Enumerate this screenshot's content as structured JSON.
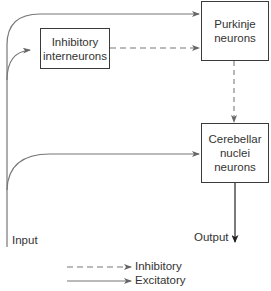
{
  "diagram": {
    "nodes": {
      "inhibitory_interneurons": {
        "line1": "Inhibitory",
        "line2": "interneurons"
      },
      "purkinje": {
        "line1": "Purkinje",
        "line2": "neurons"
      },
      "cerebellar_nuclei": {
        "line1": "Cerebellar",
        "line2": "nuclei",
        "line3": "neurons"
      }
    },
    "labels": {
      "input": "Input",
      "output": "Output"
    },
    "legend": {
      "inhibitory": "Inhibitory",
      "excitatory": "Excitatory"
    },
    "edges": [
      {
        "from": "Input",
        "to": "Purkinje neurons",
        "type": "excitatory"
      },
      {
        "from": "Input",
        "to": "Inhibitory interneurons",
        "type": "excitatory"
      },
      {
        "from": "Input",
        "to": "Cerebellar nuclei neurons",
        "type": "excitatory"
      },
      {
        "from": "Inhibitory interneurons",
        "to": "Purkinje neurons",
        "type": "inhibitory"
      },
      {
        "from": "Purkinje neurons",
        "to": "Cerebellar nuclei neurons",
        "type": "inhibitory"
      },
      {
        "from": "Cerebellar nuclei neurons",
        "to": "Output",
        "type": "excitatory"
      }
    ],
    "colors": {
      "line": "#666666",
      "box_border": "#3a3a3a",
      "output_line": "#222222"
    }
  }
}
